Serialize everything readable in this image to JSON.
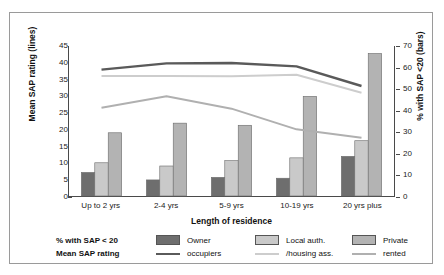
{
  "top_caption": "",
  "chart_data": {
    "type": "bar",
    "title": "",
    "subtitle": "",
    "xlabel": "Length of residence",
    "ylabel": "Mean SAP rating (lines)",
    "ylabel_right": "% with SAP <20 (bars)",
    "categories": [
      "Up to 2 yrs",
      "2-4 yrs",
      "5-9 yrs",
      "10-19 yrs",
      "20 yrs plus"
    ],
    "ylim": [
      0,
      45
    ],
    "ylim_right": [
      0,
      70
    ],
    "yticks": [
      0,
      5,
      10,
      15,
      20,
      25,
      30,
      35,
      40,
      45
    ],
    "yticks_right": [
      0,
      10,
      20,
      30,
      40,
      50,
      60,
      70
    ],
    "grid": false,
    "legend_position": "bottom",
    "bar_axis": "right",
    "line_axis": "left",
    "bar_series": [
      {
        "name": "Owner occupiers",
        "color": "#6e6e6e",
        "values": [
          11.0,
          7.5,
          8.7,
          8.3,
          18.5
        ]
      },
      {
        "name": "Local auth. /housing ass.",
        "color": "#c9c9c9",
        "values": [
          15.5,
          14.0,
          16.5,
          17.8,
          25.8
        ]
      },
      {
        "name": "Private rented",
        "color": "#b3b3b3",
        "values": [
          29.5,
          34.0,
          33.0,
          46.5,
          66.5
        ]
      }
    ],
    "line_series": [
      {
        "name": "Owner occupiers",
        "color": "#5a5a5a",
        "width": 2.4,
        "values": [
          37.9,
          39.8,
          39.9,
          38.9,
          33.0
        ]
      },
      {
        "name": "Local auth. /housing ass.",
        "color": "#cdcdcd",
        "width": 2.0,
        "values": [
          36.0,
          36.0,
          35.9,
          36.4,
          31.0
        ]
      },
      {
        "name": "Private rented",
        "color": "#b0b0b0",
        "width": 2.0,
        "values": [
          26.5,
          29.9,
          26.2,
          20.0,
          17.5
        ]
      }
    ]
  },
  "legend": {
    "row_labels": [
      "% with SAP < 20",
      "Mean SAP rating"
    ],
    "entries": [
      {
        "line1": "Owner",
        "line2": "occupiers",
        "swatch": "#6e6e6e",
        "line_color": "#5a5a5a"
      },
      {
        "line1": "Local auth.",
        "line2": "/housing ass.",
        "swatch": "#c9c9c9",
        "line_color": "#cdcdcd"
      },
      {
        "line1": "Private",
        "line2": "rented",
        "swatch": "#b3b3b3",
        "line_color": "#b0b0b0"
      }
    ]
  }
}
